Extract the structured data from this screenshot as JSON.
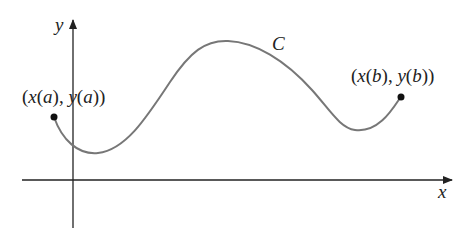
{
  "figure": {
    "curve_label": "C",
    "x_axis_label": "x",
    "y_axis_label": "y",
    "start_point": {
      "label_parts": [
        "(",
        "x",
        "(",
        "a",
        "), ",
        "y",
        "(",
        "a",
        "))"
      ],
      "label": "(x(a), y(a))"
    },
    "end_point": {
      "label_parts": [
        "(",
        "x",
        "(",
        "b",
        "), ",
        "y",
        "(",
        "b",
        "))"
      ],
      "label": "(x(b), y(b))"
    },
    "colors": {
      "axis": "#222222",
      "curve": "#777777",
      "point": "#111111",
      "text": "#222222"
    }
  }
}
